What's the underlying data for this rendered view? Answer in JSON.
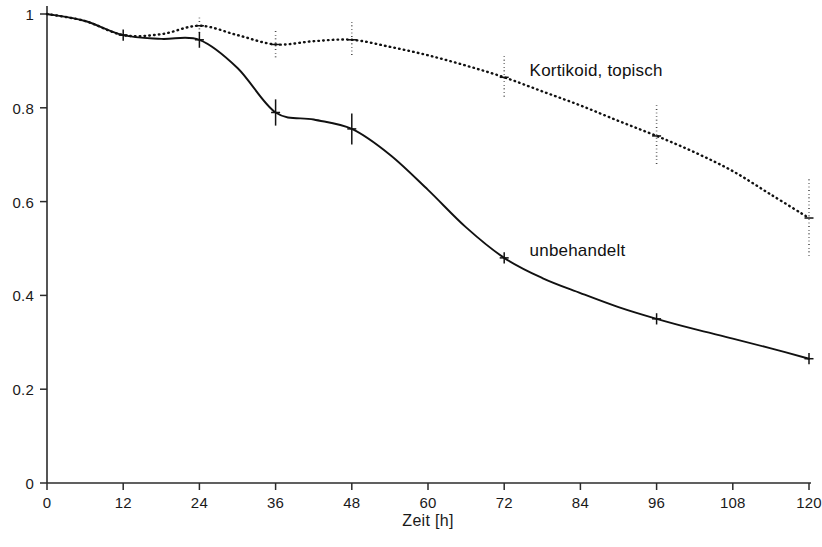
{
  "chart_data": {
    "type": "line",
    "title": "",
    "subtitle": "",
    "xlabel": "Zeit [h]",
    "ylabel": "",
    "xlim": [
      0,
      120
    ],
    "ylim": [
      0,
      1
    ],
    "grid": false,
    "legend_position": "inline-annotation",
    "x_ticks": [
      0,
      12,
      24,
      36,
      48,
      60,
      72,
      84,
      96,
      108,
      120
    ],
    "x_tick_labels": [
      "0",
      "12",
      "24",
      "36",
      "48",
      "60",
      "72",
      "84",
      "96",
      "108",
      "120"
    ],
    "y_ticks": [
      0,
      0.2,
      0.4,
      0.6,
      0.8,
      1
    ],
    "y_tick_labels": [
      "0",
      "0.2",
      "0.4",
      "0.6",
      "0.8",
      "1"
    ],
    "series": [
      {
        "name": "unbehandelt",
        "style": "solid",
        "color": "#111111",
        "annotation": "unbehandelt",
        "annotation_x": 76,
        "annotation_y": 0.49,
        "x": [
          0,
          6,
          12,
          18,
          24,
          30,
          36,
          42,
          48,
          54,
          60,
          66,
          72,
          78,
          84,
          90,
          96,
          102,
          108,
          114,
          120
        ],
        "y": [
          1.0,
          0.985,
          0.955,
          0.947,
          0.945,
          0.885,
          0.79,
          0.775,
          0.755,
          0.7,
          0.625,
          0.545,
          0.48,
          0.437,
          0.405,
          0.375,
          0.35,
          0.328,
          0.308,
          0.287,
          0.265
        ],
        "error_bars": [
          {
            "x": 12,
            "y": 0.955,
            "err": 0.012
          },
          {
            "x": 24,
            "y": 0.945,
            "err": 0.017
          },
          {
            "x": 36,
            "y": 0.79,
            "err": 0.028
          },
          {
            "x": 48,
            "y": 0.755,
            "err": 0.033
          },
          {
            "x": 72,
            "y": 0.48,
            "err": 0.012
          },
          {
            "x": 96,
            "y": 0.35,
            "err": 0.012
          },
          {
            "x": 120,
            "y": 0.265,
            "err": 0.012
          }
        ]
      },
      {
        "name": "Kortikoid, topisch",
        "style": "dotted",
        "color": "#111111",
        "annotation": "Kortikoid, topisch",
        "annotation_x": 76,
        "annotation_y": 0.875,
        "x": [
          0,
          6,
          12,
          18,
          24,
          30,
          36,
          42,
          48,
          54,
          60,
          66,
          72,
          78,
          84,
          90,
          96,
          102,
          108,
          114,
          120
        ],
        "y": [
          1.0,
          0.985,
          0.955,
          0.957,
          0.975,
          0.955,
          0.935,
          0.942,
          0.945,
          0.93,
          0.912,
          0.89,
          0.865,
          0.835,
          0.805,
          0.772,
          0.74,
          0.705,
          0.665,
          0.615,
          0.565
        ],
        "error_bars": [
          {
            "x": 24,
            "y": 0.975,
            "err": 0.017
          },
          {
            "x": 36,
            "y": 0.935,
            "err": 0.028
          },
          {
            "x": 48,
            "y": 0.945,
            "err": 0.038
          },
          {
            "x": 72,
            "y": 0.865,
            "err": 0.045
          },
          {
            "x": 96,
            "y": 0.74,
            "err": 0.065
          },
          {
            "x": 120,
            "y": 0.565,
            "err": 0.082
          }
        ]
      }
    ]
  }
}
